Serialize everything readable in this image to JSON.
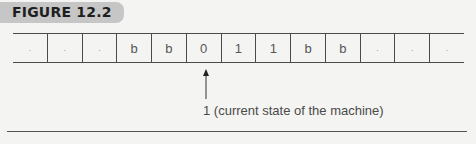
{
  "figure": {
    "label": "FIGURE 12.2"
  },
  "tape": {
    "cells": [
      ".",
      ".",
      ".",
      "b",
      "b",
      "0",
      "1",
      "1",
      "b",
      "b",
      ".",
      ".",
      "."
    ],
    "head_index": 5
  },
  "pointer": {
    "caption": "1 (current state of the machine)"
  },
  "colors": {
    "label_bg": "#c6c6c6",
    "line": "#4a4a4a",
    "background": "#f4f4f2"
  }
}
